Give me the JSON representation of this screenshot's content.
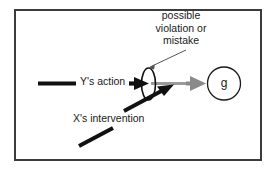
{
  "diagram": {
    "frame": {
      "border_color": "#3b3b3b",
      "background": "#ffffff"
    },
    "annotation": {
      "name": "possible-violation-annotation",
      "lines": [
        "possible",
        "violation or",
        "mistake"
      ],
      "leader_line_color": "#555555"
    },
    "labels": {
      "y_action": "Y's action",
      "x_intervention": "X's intervention",
      "goal": "g"
    },
    "colors": {
      "black": "#111111",
      "gray_arrow": "#8a8a8a",
      "gray_line": "#9a9a9a",
      "outline": "#1a1a1a",
      "leader": "#555555"
    },
    "elements": {
      "y_action_line": "thick horizontal black segment",
      "y_action_arrowhead": "black triangle pointing right",
      "barrier_ellipse": "vertical ellipse outline",
      "x_intervention_arrow": "thick black diagonal arrow pointing up-right",
      "x_intervention_tail": "thick black diagonal segment",
      "gray_connector": "gray horizontal segment",
      "goal_arrowhead": "gray triangle pointing right",
      "goal_circle": "circle outline containing g"
    }
  }
}
